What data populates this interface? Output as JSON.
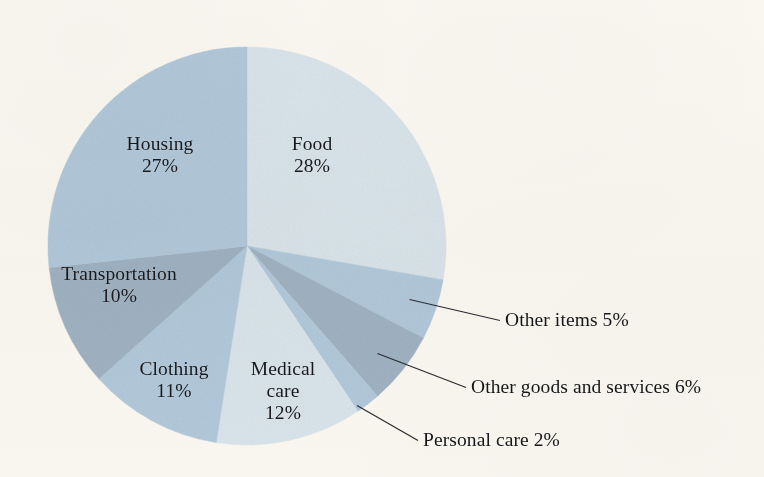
{
  "figure": {
    "background_color": "#fbfaf6",
    "text_color": "#16181c"
  },
  "chart_data": {
    "type": "pie",
    "title": "",
    "subtitle": "",
    "xlabel": "",
    "ylabel": "",
    "legend_position": "none",
    "grid": false,
    "labels_inside_slices": true,
    "start_angle_deg": 0,
    "direction": "clockwise",
    "units": "percent",
    "categories": [
      "Food",
      "Other items",
      "Other goods and services",
      "Personal care",
      "Medical care",
      "Clothing",
      "Transportation",
      "Housing"
    ],
    "values": [
      28,
      5,
      6,
      2,
      12,
      11,
      10,
      27
    ],
    "colors": [
      "#dde9f3",
      "#b5cde2",
      "#a3b6c9",
      "#b5cde2",
      "#dde9f3",
      "#b5cde2",
      "#a3b6c9",
      "#b5cde2"
    ],
    "slices": [
      {
        "name": "Food",
        "value": 28,
        "label": "Food",
        "value_label": "28%",
        "color": "#dde9f3",
        "label_placement": "inside"
      },
      {
        "name": "Other items",
        "value": 5,
        "label": "Other items",
        "value_label": "5%",
        "color": "#b5cde2",
        "label_placement": "callout"
      },
      {
        "name": "Other goods and services",
        "value": 6,
        "label": "Other goods and services",
        "value_label": "6%",
        "color": "#a3b6c9",
        "label_placement": "callout"
      },
      {
        "name": "Personal care",
        "value": 2,
        "label": "Personal care",
        "value_label": "2%",
        "color": "#b5cde2",
        "label_placement": "callout"
      },
      {
        "name": "Medical care",
        "value": 12,
        "label": "Medical care",
        "value_label": "12%",
        "color": "#dde9f3",
        "label_placement": "inside"
      },
      {
        "name": "Clothing",
        "value": 11,
        "label": "Clothing",
        "value_label": "11%",
        "color": "#b5cde2",
        "label_placement": "inside"
      },
      {
        "name": "Transportation",
        "value": 10,
        "label": "Transportation",
        "value_label": "10%",
        "color": "#a3b6c9",
        "label_placement": "inside"
      },
      {
        "name": "Housing",
        "value": 27,
        "label": "Housing",
        "value_label": "27%",
        "color": "#b5cde2",
        "label_placement": "inside"
      }
    ]
  },
  "inside_labels": {
    "food": {
      "name": "Food",
      "percent": "28%"
    },
    "housing": {
      "name": "Housing",
      "percent": "27%"
    },
    "transportation": {
      "name": "Transportation",
      "percent": "10%"
    },
    "clothing": {
      "name": "Clothing",
      "percent": "11%"
    },
    "medical_care": {
      "name_line1": "Medical",
      "name_line2": "care",
      "percent": "12%"
    }
  },
  "callouts": {
    "other_items": {
      "text": "Other items 5%"
    },
    "other_goods_and_services": {
      "text": "Other goods and services 6%"
    },
    "personal_care": {
      "text": "Personal care 2%"
    }
  }
}
